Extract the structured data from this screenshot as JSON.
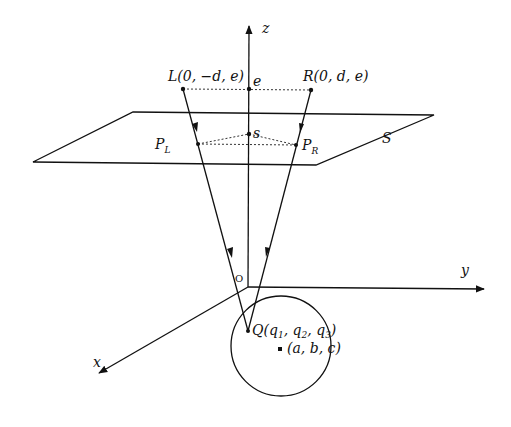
{
  "diagram": {
    "axes": {
      "z_label": "z",
      "y_label": "y",
      "x_label": "x",
      "origin_label": "O"
    },
    "points": {
      "L": "L(0, −d, e)",
      "R": "R(0, d, e)",
      "e": "e",
      "s": "s",
      "PL_main": "P",
      "PL_sub": "L",
      "PR_main": "P",
      "PR_sub": "R",
      "Q": "Q(q",
      "Q_sub1": "1",
      "Q_mid1": ", q",
      "Q_sub2": "2",
      "Q_mid2": ", q",
      "Q_sub3": "3",
      "Q_end": ")",
      "center": "(a, b, c)"
    },
    "plane_label": "S"
  }
}
